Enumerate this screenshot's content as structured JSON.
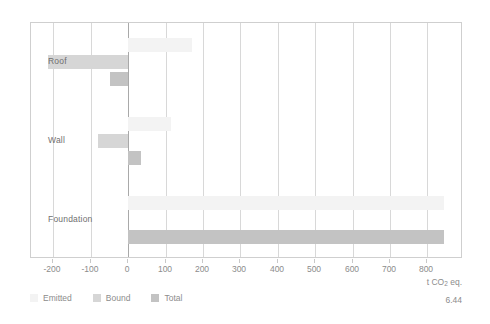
{
  "chart_data": {
    "type": "bar",
    "orientation": "horizontal",
    "title": "",
    "xlabel": "t CO2 eq.",
    "ylabel": "",
    "categories": [
      "Roof",
      "Wall",
      "Foundation"
    ],
    "series": [
      {
        "name": "Emitted",
        "color": "#f3f3f3",
        "values": [
          170,
          115,
          845
        ]
      },
      {
        "name": "Bound",
        "color": "#d6d6d6",
        "values": [
          -215,
          -80,
          0
        ]
      },
      {
        "name": "Total",
        "color": "#c3c3c3",
        "values": [
          -50,
          35,
          845
        ]
      }
    ],
    "xlim": [
      -260,
      895
    ],
    "xticks": [
      -200,
      -100,
      0,
      100,
      200,
      300,
      400,
      500,
      600,
      700,
      800
    ],
    "xtick_labels": [
      "-200",
      "-100",
      "0",
      "100",
      "200",
      "300",
      "400",
      "500",
      "600",
      "700",
      "800"
    ],
    "grid": "vertical",
    "legend_position": "bottom-left"
  },
  "axis": {
    "unit_prefix": "t CO",
    "unit_sub": "2",
    "unit_suffix": " eq."
  },
  "figure": {
    "number": "6.44"
  },
  "legend": {
    "items": [
      {
        "label": "Emitted",
        "color": "#f3f3f3"
      },
      {
        "label": "Bound",
        "color": "#d6d6d6"
      },
      {
        "label": "Total",
        "color": "#c3c3c3"
      }
    ]
  }
}
